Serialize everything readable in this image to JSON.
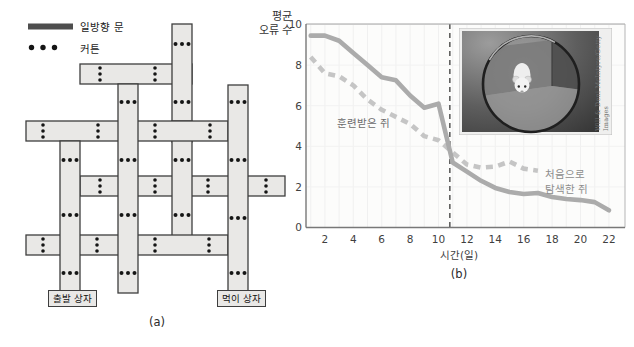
{
  "panel_a": {
    "caption": "(a)",
    "legend": {
      "door_label": "일방향 문",
      "curtain_label": "커튼"
    },
    "start_box_label": "출발 상자",
    "food_box_label": "먹이 상자",
    "maze": {
      "bar_fill": "#e9e8e6",
      "bar_stroke": "#3e3e3e",
      "dot_color": "#151515",
      "legend_bar_color": "#4e4e4e",
      "bars": [
        {
          "t": "h",
          "x": 80,
          "y": 176,
          "w": 205,
          "h": 20,
          "dots": [
            100,
            155,
            208,
            266
          ]
        },
        {
          "t": "h",
          "x": 80,
          "y": 64,
          "w": 112,
          "h": 20,
          "dots": [
            100,
            155
          ]
        },
        {
          "t": "v",
          "x": 172,
          "y": 24,
          "w": 20,
          "h": 118,
          "dots": [
            44,
            102
          ]
        },
        {
          "t": "v",
          "x": 172,
          "y": 121,
          "w": 20,
          "h": 124,
          "dots": [
            160,
            215
          ]
        },
        {
          "t": "h",
          "x": 26,
          "y": 121,
          "w": 202,
          "h": 20,
          "dots": [
            43,
            98,
            155,
            210
          ]
        },
        {
          "t": "h",
          "x": 26,
          "y": 235,
          "w": 202,
          "h": 20,
          "dots": [
            43,
            97,
            155,
            209
          ]
        },
        {
          "t": "v",
          "x": 60,
          "y": 141,
          "w": 20,
          "h": 152,
          "dots": [
            160,
            215,
            273
          ]
        },
        {
          "t": "v",
          "x": 118,
          "y": 84,
          "w": 20,
          "h": 209,
          "dots": [
            102,
            160,
            215,
            273
          ]
        },
        {
          "t": "v",
          "x": 228,
          "y": 85,
          "w": 20,
          "h": 208,
          "dots": [
            102,
            160,
            218,
            273
          ]
        }
      ]
    }
  },
  "panel_b": {
    "caption": "(b)",
    "ylabel_line1": "평균",
    "ylabel_line2": "오류 수",
    "xlabel": "시간(일)",
    "label_trained": "훈련받은 쥐",
    "label_novel_line1": "처음으로",
    "label_novel_line2": "탐색한 쥐",
    "photo_credit": "Will & Deni McIntyre/Getty Images"
  },
  "chart_data": {
    "type": "line",
    "title": "",
    "xlabel": "시간(일)",
    "ylabel": "평균 오류 수",
    "x_ticks": [
      2,
      4,
      6,
      8,
      10,
      12,
      14,
      16,
      18,
      20,
      22
    ],
    "y_ticks": [
      0,
      2,
      4,
      6,
      8,
      10
    ],
    "xlim": [
      0,
      23
    ],
    "ylim": [
      0,
      10
    ],
    "grid": true,
    "legend_position": "inline-annotations",
    "vline_day": 10.8,
    "vline_color": "#3a3a3a",
    "series": [
      {
        "name": "훈련받은 쥐",
        "style": "dashed",
        "color": "#c5c5c5",
        "x": [
          1,
          2,
          3,
          4,
          5,
          6,
          7,
          8,
          9,
          10,
          11,
          12,
          13,
          14,
          15,
          16,
          17
        ],
        "values": [
          8.4,
          7.6,
          7.45,
          7.0,
          6.3,
          5.8,
          5.45,
          5.1,
          4.5,
          4.3,
          3.7,
          3.1,
          2.95,
          3.0,
          3.25,
          2.9,
          2.8
        ]
      },
      {
        "name": "처음으로 탐색한 쥐",
        "style": "solid",
        "color": "#ababab",
        "x": [
          1,
          2,
          3,
          4,
          5,
          6,
          7,
          8,
          9,
          10,
          11,
          12,
          13,
          14,
          15,
          16,
          17,
          18,
          19,
          20,
          21,
          22
        ],
        "values": [
          9.45,
          9.45,
          9.2,
          8.6,
          8.0,
          7.4,
          7.25,
          6.5,
          5.9,
          6.1,
          3.2,
          2.75,
          2.3,
          1.95,
          1.75,
          1.65,
          1.7,
          1.5,
          1.4,
          1.35,
          1.25,
          0.85
        ]
      }
    ]
  }
}
